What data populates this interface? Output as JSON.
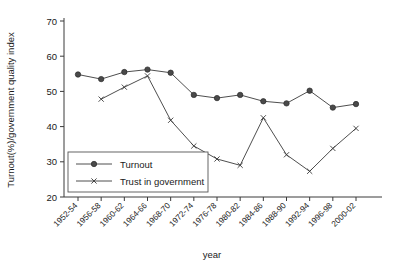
{
  "chart_data": {
    "type": "line",
    "title": "",
    "xlabel": "year",
    "ylabel": "Turnout(%)/government quality index",
    "ylim": [
      20,
      72
    ],
    "yticks": [
      20,
      30,
      40,
      50,
      60,
      70
    ],
    "grid": false,
    "legend_position": "inside-bottom-left",
    "categories": [
      "1952-54",
      "1956-58",
      "1960-62",
      "1964-66",
      "1968-70",
      "1972-74",
      "1976-78",
      "1980-82",
      "1984-86",
      "1988-90",
      "1992-94",
      "1996-98",
      "2000-02"
    ],
    "series": [
      {
        "name": "Turnout",
        "marker": "filled-circle",
        "values": [
          54.8,
          53.5,
          55.5,
          56.2,
          55.3,
          49.0,
          48.1,
          49.0,
          47.2,
          46.6,
          50.2,
          45.4,
          46.4
        ]
      },
      {
        "name": "Trust in government",
        "marker": "x",
        "values": [
          null,
          47.8,
          51.2,
          54.4,
          41.8,
          34.5,
          30.8,
          29.0,
          42.5,
          32.0,
          27.3,
          33.8,
          39.5
        ]
      }
    ],
    "colors": {
      "axis": "#3a3a3a",
      "turnout_marker": "#4a4a4a",
      "trust_marker": "#3a3a3a",
      "background": "#ffffff"
    }
  },
  "legend": {
    "items": [
      {
        "label": "Turnout"
      },
      {
        "label": "Trust in government"
      }
    ]
  }
}
